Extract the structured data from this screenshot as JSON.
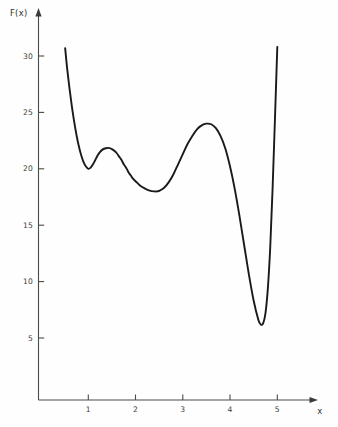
{
  "chart_data": {
    "type": "line",
    "title": "",
    "xlabel": "x",
    "ylabel": "F(x)",
    "xlim": [
      0.3,
      5.35
    ],
    "ylim": [
      0,
      32.5
    ],
    "grid": false,
    "legend": null,
    "x_ticks": [
      1,
      2,
      3,
      4,
      5
    ],
    "x_tick_labels": [
      "1",
      "2",
      "3",
      "4",
      "5"
    ],
    "y_ticks": [
      5,
      10,
      15,
      20,
      25,
      30
    ],
    "y_tick_labels": [
      "5",
      "10",
      "15",
      "20",
      "25",
      "30"
    ],
    "series": [
      {
        "name": "F(x)",
        "color": "#1a1a1a",
        "x": [
          0.51,
          0.55,
          0.6,
          0.65,
          0.7,
          0.75,
          0.8,
          0.85,
          0.9,
          0.95,
          1.0,
          1.05,
          1.1,
          1.15,
          1.2,
          1.25,
          1.3,
          1.35,
          1.4,
          1.45,
          1.5,
          1.55,
          1.6,
          1.65,
          1.7,
          1.75,
          1.8,
          1.85,
          1.9,
          1.95,
          2.0,
          2.1,
          2.2,
          2.3,
          2.4,
          2.45,
          2.5,
          2.6,
          2.7,
          2.8,
          2.9,
          3.0,
          3.1,
          3.2,
          3.3,
          3.4,
          3.5,
          3.6,
          3.7,
          3.8,
          3.9,
          4.0,
          4.1,
          4.2,
          4.3,
          4.4,
          4.5,
          4.6,
          4.65,
          4.7,
          4.75,
          4.8,
          4.85,
          4.9,
          4.95,
          5.0
        ],
        "y": [
          30.7,
          29.0,
          27.2,
          25.6,
          24.2,
          23.0,
          22.0,
          21.2,
          20.6,
          20.2,
          20.0,
          20.1,
          20.4,
          20.8,
          21.2,
          21.5,
          21.7,
          21.8,
          21.85,
          21.83,
          21.75,
          21.6,
          21.4,
          21.1,
          20.8,
          20.4,
          20.1,
          19.7,
          19.4,
          19.1,
          18.9,
          18.5,
          18.25,
          18.07,
          18.0,
          18.0,
          18.05,
          18.3,
          18.8,
          19.5,
          20.4,
          21.3,
          22.2,
          22.9,
          23.5,
          23.85,
          24.0,
          23.95,
          23.6,
          22.9,
          21.8,
          20.2,
          18.2,
          15.8,
          13.2,
          10.6,
          8.3,
          6.6,
          6.2,
          6.3,
          7.2,
          9.4,
          13.0,
          18.2,
          24.4,
          30.8
        ],
        "annotations": [
          {
            "label": "local minimum",
            "x": 1.0,
            "y": 20.0
          },
          {
            "label": "local maximum",
            "x": 1.42,
            "y": 21.85
          },
          {
            "label": "local minimum",
            "x": 2.42,
            "y": 18.0
          },
          {
            "label": "local maximum",
            "x": 3.5,
            "y": 24.0
          },
          {
            "label": "global minimum",
            "x": 4.65,
            "y": 6.2
          }
        ]
      }
    ]
  },
  "axes": {
    "y_axis_title": "F(x)",
    "x_axis_title": "x"
  }
}
